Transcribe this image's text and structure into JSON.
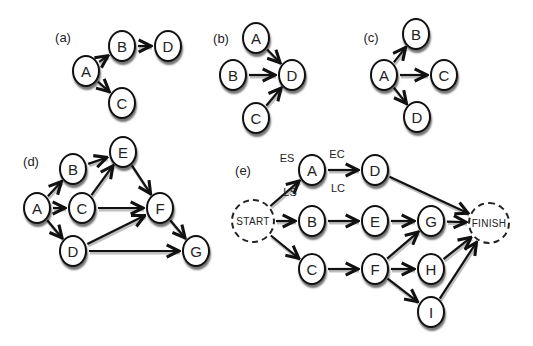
{
  "panels": [
    {
      "id": "a",
      "label": "(a)",
      "label_pos": [
        63,
        37
      ],
      "nodes": [
        {
          "id": "A",
          "label": "A",
          "x": 86,
          "y": 71
        },
        {
          "id": "B",
          "label": "B",
          "x": 122,
          "y": 46
        },
        {
          "id": "D",
          "label": "D",
          "x": 168,
          "y": 46
        },
        {
          "id": "C",
          "label": "C",
          "x": 122,
          "y": 103
        }
      ],
      "edges": [
        [
          "A",
          "B"
        ],
        [
          "B",
          "D"
        ],
        [
          "A",
          "C"
        ]
      ]
    },
    {
      "id": "b",
      "label": "(b)",
      "label_pos": [
        221,
        38
      ],
      "nodes": [
        {
          "id": "A",
          "label": "A",
          "x": 256,
          "y": 38
        },
        {
          "id": "B",
          "label": "B",
          "x": 233,
          "y": 75
        },
        {
          "id": "D",
          "label": "D",
          "x": 292,
          "y": 75
        },
        {
          "id": "C",
          "label": "C",
          "x": 256,
          "y": 118
        }
      ],
      "edges": [
        [
          "A",
          "D"
        ],
        [
          "B",
          "D"
        ],
        [
          "C",
          "D"
        ]
      ]
    },
    {
      "id": "c",
      "label": "(c)",
      "label_pos": [
        371,
        37
      ],
      "nodes": [
        {
          "id": "A",
          "label": "A",
          "x": 384,
          "y": 75
        },
        {
          "id": "B",
          "label": "B",
          "x": 416,
          "y": 34
        },
        {
          "id": "C",
          "label": "C",
          "x": 444,
          "y": 75
        },
        {
          "id": "D",
          "label": "D",
          "x": 417,
          "y": 117
        }
      ],
      "edges": [
        [
          "A",
          "B"
        ],
        [
          "A",
          "C"
        ],
        [
          "A",
          "D"
        ]
      ]
    },
    {
      "id": "d",
      "label": "(d)",
      "label_pos": [
        31,
        161
      ],
      "nodes": [
        {
          "id": "A",
          "label": "A",
          "x": 37,
          "y": 208
        },
        {
          "id": "B",
          "label": "B",
          "x": 73,
          "y": 169
        },
        {
          "id": "C",
          "label": "C",
          "x": 82,
          "y": 208
        },
        {
          "id": "D",
          "label": "D",
          "x": 73,
          "y": 251
        },
        {
          "id": "E",
          "label": "E",
          "x": 123,
          "y": 152
        },
        {
          "id": "F",
          "label": "F",
          "x": 160,
          "y": 208
        },
        {
          "id": "G",
          "label": "G",
          "x": 196,
          "y": 251
        }
      ],
      "edges": [
        [
          "A",
          "B"
        ],
        [
          "A",
          "C"
        ],
        [
          "A",
          "D"
        ],
        [
          "B",
          "E"
        ],
        [
          "C",
          "E"
        ],
        [
          "C",
          "F"
        ],
        [
          "E",
          "F"
        ],
        [
          "D",
          "F"
        ],
        [
          "D",
          "G"
        ],
        [
          "F",
          "G"
        ]
      ]
    },
    {
      "id": "e",
      "label": "(e)",
      "label_pos": [
        243,
        170
      ],
      "nodes": [
        {
          "id": "START",
          "label": "START",
          "x": 253,
          "y": 221,
          "r": 22,
          "dashed": true
        },
        {
          "id": "A",
          "label": "A",
          "x": 312,
          "y": 170
        },
        {
          "id": "D",
          "label": "D",
          "x": 375,
          "y": 170
        },
        {
          "id": "B",
          "label": "B",
          "x": 312,
          "y": 221
        },
        {
          "id": "E",
          "label": "E",
          "x": 375,
          "y": 221
        },
        {
          "id": "C",
          "label": "C",
          "x": 312,
          "y": 269
        },
        {
          "id": "F",
          "label": "F",
          "x": 375,
          "y": 269
        },
        {
          "id": "G",
          "label": "G",
          "x": 431,
          "y": 221
        },
        {
          "id": "H",
          "label": "H",
          "x": 431,
          "y": 269
        },
        {
          "id": "I",
          "label": "I",
          "x": 431,
          "y": 312
        },
        {
          "id": "FINISH",
          "label": "FINISH",
          "x": 489,
          "y": 223,
          "r": 21,
          "dashed": true
        }
      ],
      "edges": [
        [
          "START",
          "A"
        ],
        [
          "START",
          "B"
        ],
        [
          "START",
          "C"
        ],
        [
          "A",
          "D"
        ],
        [
          "B",
          "E"
        ],
        [
          "C",
          "F"
        ],
        [
          "D",
          "FINISH"
        ],
        [
          "E",
          "G"
        ],
        [
          "F",
          "G"
        ],
        [
          "F",
          "H"
        ],
        [
          "F",
          "I"
        ],
        [
          "G",
          "FINISH"
        ],
        [
          "H",
          "FINISH"
        ],
        [
          "I",
          "FINISH"
        ]
      ],
      "annotations": [
        {
          "text": "ES",
          "x": 287,
          "y": 158
        },
        {
          "text": "EC",
          "x": 337,
          "y": 154
        },
        {
          "text": "LS",
          "x": 290,
          "y": 192
        },
        {
          "text": "LC",
          "x": 338,
          "y": 188
        }
      ]
    }
  ],
  "style": {
    "node_radius": 15,
    "stroke": "#111111",
    "fill": "#ffffff"
  }
}
